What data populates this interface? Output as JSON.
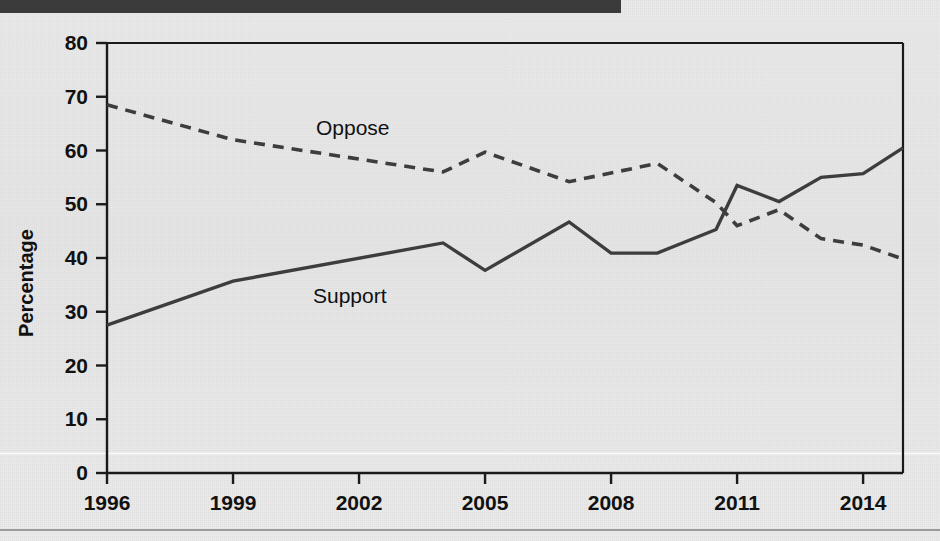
{
  "figure": {
    "background_color": "#e9e9e9",
    "masthead_color": "#3b3b3b",
    "rule_color": "#9a9a9a"
  },
  "chart_data": {
    "type": "line",
    "title": "",
    "subtitle": "",
    "xlabel": "",
    "ylabel": "Percentage",
    "xlim": [
      1996,
      2014.95
    ],
    "ylim": [
      0,
      80
    ],
    "grid": false,
    "legend_position": "inline-annotation",
    "x_ticks": [
      1996,
      1999,
      2002,
      2005,
      2008,
      2011,
      2014
    ],
    "x_tick_labels": [
      "1996",
      "1999",
      "2002",
      "2005",
      "2008",
      "2011",
      "2014"
    ],
    "y_ticks": [
      0,
      10,
      20,
      30,
      40,
      50,
      60,
      70,
      80
    ],
    "y_tick_labels": [
      "0",
      "10",
      "20",
      "30",
      "40",
      "50",
      "60",
      "70",
      "80"
    ],
    "series": [
      {
        "name": "Support",
        "style": "solid",
        "color": "#3d3d3d",
        "label_text": "Support",
        "points": [
          {
            "x": 1996.0,
            "y": 27.5
          },
          {
            "x": 1999.0,
            "y": 35.7
          },
          {
            "x": 2004.0,
            "y": 42.8
          },
          {
            "x": 2005.0,
            "y": 37.7
          },
          {
            "x": 2007.0,
            "y": 46.7
          },
          {
            "x": 2008.0,
            "y": 40.9
          },
          {
            "x": 2009.1,
            "y": 40.9
          },
          {
            "x": 2010.5,
            "y": 45.3
          },
          {
            "x": 2011.0,
            "y": 53.5
          },
          {
            "x": 2012.0,
            "y": 50.5
          },
          {
            "x": 2013.0,
            "y": 55.0
          },
          {
            "x": 2014.0,
            "y": 55.7
          },
          {
            "x": 2014.95,
            "y": 60.5
          }
        ]
      },
      {
        "name": "Oppose",
        "style": "dashed",
        "color": "#3d3d3d",
        "label_text": "Oppose",
        "points": [
          {
            "x": 1996.0,
            "y": 68.5
          },
          {
            "x": 1999.0,
            "y": 62.0
          },
          {
            "x": 2004.0,
            "y": 56.0
          },
          {
            "x": 2005.0,
            "y": 59.7
          },
          {
            "x": 2007.0,
            "y": 54.2
          },
          {
            "x": 2009.1,
            "y": 57.6
          },
          {
            "x": 2010.5,
            "y": 50.3
          },
          {
            "x": 2011.0,
            "y": 46.0
          },
          {
            "x": 2012.0,
            "y": 49.0
          },
          {
            "x": 2013.0,
            "y": 43.6
          },
          {
            "x": 2014.0,
            "y": 42.4
          },
          {
            "x": 2014.95,
            "y": 39.8
          }
        ]
      }
    ],
    "annotations": [
      {
        "text": "Oppose",
        "x_px": 316,
        "y_px": 135
      },
      {
        "text": "Support",
        "x_px": 313,
        "y_px": 303
      }
    ]
  }
}
